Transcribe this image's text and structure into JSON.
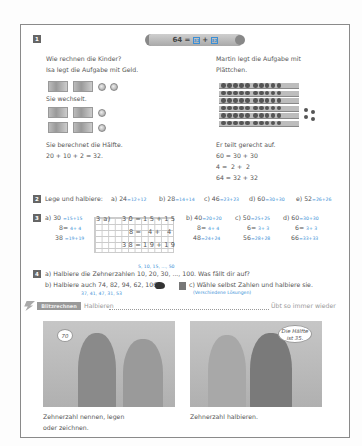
{
  "exercise1": {
    "number": "1",
    "banner": {
      "equation": "64 =",
      "box1": "32",
      "plus": "+",
      "box2": "32"
    },
    "left": {
      "line1": "Wie rechnen die Kinder?",
      "line2": "Isa legt die Aufgabe mit Geld.",
      "money_row1": [
        "50-euro-note",
        "10-euro-note",
        "2-euro-coin",
        "2-euro-coin"
      ],
      "exchange": "Sie wechselt.",
      "money_row2": [
        "20-euro-note",
        "10-euro-note",
        "2-euro-coin"
      ],
      "money_row3": [
        "20-euro-note",
        "10-euro-note",
        "2-euro-coin"
      ],
      "half_text": "Sie berechnet die Hälfte.",
      "half_calc": "20 + 10 + 2 = 32."
    },
    "right": {
      "line1": "Martin legt die Aufgabe mit",
      "line2": "Plättchen.",
      "strips_count": 6,
      "loose_dots": 4,
      "split_text": "Er teilt gerecht auf.",
      "calc1": "60 = 30 + 30",
      "calc2": "4 =  2 +  2",
      "calc3": "64 = 32 + 32"
    }
  },
  "exercise2": {
    "number": "2",
    "prompt": "Lege und halbiere:",
    "items": [
      {
        "label": "a) 24",
        "answer": "=12+12"
      },
      {
        "label": "b) 28",
        "answer": "=14+14"
      },
      {
        "label": "c) 46",
        "answer": "=23+23"
      },
      {
        "label": "d) 60",
        "answer": "=30+30"
      },
      {
        "label": "e) 52",
        "answer": "=26+26"
      }
    ]
  },
  "exercise3": {
    "number": "3",
    "a": {
      "label": "a) 30",
      "rows": [
        {
          "q": "30",
          "a": "=15+15"
        },
        {
          "q": "8=",
          "a": "4+ 4"
        },
        {
          "q": "38",
          "a": "=19+19"
        }
      ]
    },
    "grid": {
      "label": "3 a)",
      "row1": "30=15+15",
      "row2": "8= 4+ 4",
      "row3": "38=19+19"
    },
    "b": {
      "rows": [
        "b) 40",
        "8=",
        "48"
      ],
      "answers": [
        "=20+20",
        "4+ 4",
        "=24+24"
      ]
    },
    "c": {
      "rows": [
        "c) 50",
        "6=",
        "56"
      ],
      "answers": [
        "=25+25",
        "3+ 3",
        "=28+28"
      ]
    },
    "d": {
      "rows": [
        "d) 60",
        "6=",
        "66"
      ],
      "answers": [
        "=30+30",
        "3+ 3",
        "=33+33"
      ]
    }
  },
  "exercise4": {
    "number": "4",
    "a_answer": "5, 10, 15, ..., 50",
    "a_text": "a) Halbiere die Zehnerzahlen 10, 20, 30, ..., 100. Was fällt dir auf?",
    "b_text": "b) Halbiere auch 74, 82, 94, 62, 106.",
    "b_answer": "37, 41, 47, 31, 53",
    "c_text": "c) Wähle selbst Zahlen und halbiere sie.",
    "c_answer": "(Verschiedene Lösungen)"
  },
  "flash": {
    "label": "Blitzrechnen",
    "topic": "Halbieren",
    "right": "Übt so immer wieder"
  },
  "illustrations": [
    {
      "bubble": "70",
      "caption1": "Zehnerzahl nennen, legen",
      "caption2": "oder zeichnen."
    },
    {
      "bubble": "Die Hälfte ist 35.",
      "caption1": "Zehnerzahl halbieren.",
      "caption2": ""
    }
  ],
  "colors": {
    "answer_blue": "#3a8fd6",
    "badge_gray": "#666666",
    "border": "#8a8a8a"
  }
}
